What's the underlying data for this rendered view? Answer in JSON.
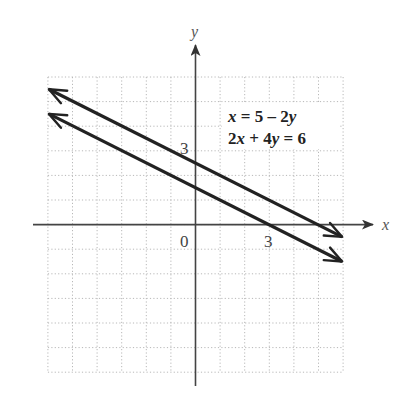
{
  "chart_data": {
    "type": "line",
    "title": "",
    "xlabel": "x",
    "ylabel": "y",
    "xlim": [
      -6,
      6
    ],
    "ylim": [
      -6,
      6
    ],
    "grid": true,
    "grid_style": "dotted",
    "tick_labels": {
      "origin": "0",
      "x": [
        {
          "value": 3,
          "label": "3"
        }
      ],
      "y": [
        {
          "value": 3,
          "label": "3"
        }
      ]
    },
    "series": [
      {
        "name": "x = 5 – 2y",
        "equation": "x = 5 - 2y",
        "slope": -0.5,
        "y_intercept": 2.5,
        "x": [
          -6,
          6
        ],
        "y": [
          5.5,
          -0.5
        ]
      },
      {
        "name": "2x + 4y = 6",
        "equation": "2x + 4y = 6",
        "slope": -0.5,
        "y_intercept": 1.5,
        "x": [
          -6,
          6
        ],
        "y": [
          4.5,
          -1.5
        ]
      }
    ],
    "annotations": [
      {
        "text": "x = 5 – 2y",
        "position": "upper right"
      },
      {
        "text": "2x + 4y = 6",
        "position": "upper right"
      }
    ],
    "line_color": "#222222",
    "axis_color": "#444444",
    "grid_color": "#b8b8b8"
  },
  "labels": {
    "x_axis": "x",
    "y_axis": "y",
    "origin": "0",
    "x_tick_3": "3",
    "y_tick_3": "3",
    "eq1_parts": [
      "x",
      " = 5 – 2",
      "y"
    ],
    "eq2_parts": [
      "2",
      "x",
      " + 4",
      "y",
      " = 6"
    ]
  }
}
